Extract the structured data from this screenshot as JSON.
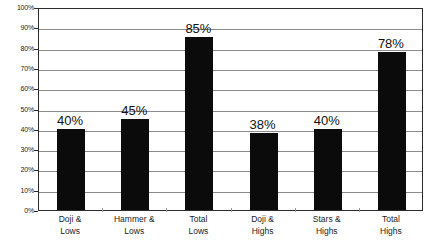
{
  "chart_data": {
    "type": "bar",
    "title": "",
    "xlabel": "",
    "ylabel": "",
    "ylim": [
      0,
      100
    ],
    "grid": true,
    "legend": "none",
    "categories": [
      "Doji & Lows",
      "Hammer & Lows",
      "Total Lows",
      "Doji & Highs",
      "Stars & Highs",
      "Total Highs"
    ],
    "category_lines": [
      [
        "Doji &",
        "Lows"
      ],
      [
        "Hammer &",
        "Lows"
      ],
      [
        "Total",
        "Lows"
      ],
      [
        "Doji &",
        "Highs"
      ],
      [
        "Stars &",
        "Highs"
      ],
      [
        "Total",
        "Highs"
      ]
    ],
    "values": [
      40,
      45,
      85,
      38,
      40,
      78
    ],
    "data_labels": [
      "40%",
      "45%",
      "85%",
      "38%",
      "40%",
      "78%"
    ],
    "ytick_labels": [
      "100%",
      "90%",
      "80%",
      "70%",
      "60%",
      "50%",
      "40%",
      "30%",
      "20%",
      "10%",
      "0%"
    ],
    "ytick_values": [
      100,
      90,
      80,
      70,
      60,
      50,
      40,
      30,
      20,
      10,
      0
    ],
    "bar_color": "#0b0b0b",
    "grid_color": "#8a8a8a",
    "axis_color": "#2b2b2b",
    "background_color": "#ffffff"
  }
}
